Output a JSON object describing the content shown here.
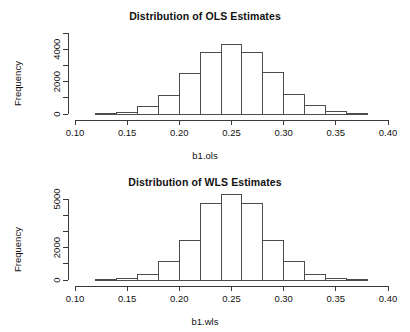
{
  "chart_data": [
    {
      "type": "bar",
      "title": "Distribution of OLS Estimates",
      "xlabel": "b1.ols",
      "ylabel": "Frequency",
      "grid": false,
      "legend": "none",
      "xlim": [
        0.1,
        0.4
      ],
      "ylim": [
        0,
        5000
      ],
      "xticks": [
        0.1,
        0.15,
        0.2,
        0.25,
        0.3,
        0.35,
        0.4
      ],
      "xticklabels": [
        "0.10",
        "0.15",
        "0.20",
        "0.25",
        "0.30",
        "0.35",
        "0.40"
      ],
      "yticks": [
        0,
        1000,
        2000,
        3000,
        4000,
        5000
      ],
      "yticklabels": [
        "0",
        "",
        "2000",
        "",
        "4000",
        ""
      ],
      "bin_width": 0.02,
      "bin_edges": [
        0.12,
        0.14,
        0.16,
        0.18,
        0.2,
        0.22,
        0.24,
        0.26,
        0.28,
        0.3,
        0.32,
        0.34,
        0.36,
        0.38
      ],
      "categories": [
        "0.12-0.14",
        "0.14-0.16",
        "0.16-0.18",
        "0.18-0.20",
        "0.20-0.22",
        "0.22-0.24",
        "0.24-0.26",
        "0.26-0.28",
        "0.28-0.30",
        "0.30-0.32",
        "0.32-0.34",
        "0.34-0.36",
        "0.36-0.38"
      ],
      "values": [
        30,
        120,
        450,
        1150,
        2500,
        3800,
        4300,
        3800,
        2550,
        1200,
        500,
        150,
        40
      ]
    },
    {
      "type": "bar",
      "title": "Distribution of WLS Estimates",
      "xlabel": "b1.wls",
      "ylabel": "Frequency",
      "grid": false,
      "legend": "none",
      "xlim": [
        0.1,
        0.4
      ],
      "ylim": [
        0,
        5500
      ],
      "xticks": [
        0.1,
        0.15,
        0.2,
        0.25,
        0.3,
        0.35,
        0.4
      ],
      "xticklabels": [
        "0.10",
        "0.15",
        "0.20",
        "0.25",
        "0.30",
        "0.35",
        "0.40"
      ],
      "yticks": [
        0,
        1000,
        2000,
        3000,
        4000,
        5000
      ],
      "yticklabels": [
        "0",
        "",
        "2000",
        "",
        "",
        "5000"
      ],
      "bin_width": 0.02,
      "bin_edges": [
        0.12,
        0.14,
        0.16,
        0.18,
        0.2,
        0.22,
        0.24,
        0.26,
        0.28,
        0.3,
        0.32,
        0.34,
        0.36,
        0.38
      ],
      "categories": [
        "0.12-0.14",
        "0.14-0.16",
        "0.16-0.18",
        "0.18-0.20",
        "0.20-0.22",
        "0.22-0.24",
        "0.24-0.26",
        "0.26-0.28",
        "0.28-0.30",
        "0.30-0.32",
        "0.32-0.34",
        "0.34-0.36",
        "0.36-0.38"
      ],
      "values": [
        20,
        90,
        330,
        1150,
        2450,
        4700,
        5250,
        4700,
        2450,
        1150,
        330,
        90,
        20
      ]
    }
  ],
  "panels": [
    {
      "title": "Distribution of OLS Estimates",
      "xlabel": "b1.ols",
      "ylabel": "Frequency"
    },
    {
      "title": "Distribution of WLS Estimates",
      "xlabel": "b1.wls",
      "ylabel": "Frequency"
    }
  ],
  "colors": {
    "background": "#ffffff",
    "axis": "#3a3a3a",
    "bar_stroke": "#4c4c4c",
    "text": "#111111"
  }
}
